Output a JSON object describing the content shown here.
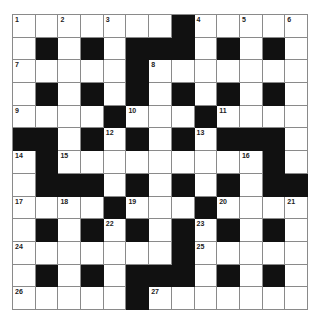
{
  "puzzle": {
    "type": "crossword",
    "size": {
      "rows": 13,
      "cols": 13
    },
    "colors": {
      "block": "#111111",
      "cell": "#ffffff",
      "grid_line": "#8a8a8a"
    },
    "grid": [
      [
        "1",
        "W",
        "2",
        "W",
        "3",
        "W",
        "W",
        "B",
        "4",
        "W",
        "5",
        "W",
        "6"
      ],
      [
        "W",
        "B",
        "W",
        "B",
        "W",
        "B",
        "B",
        "B",
        "W",
        "B",
        "W",
        "B",
        "W"
      ],
      [
        "7",
        "W",
        "W",
        "W",
        "W",
        "B",
        "8",
        "W",
        "W",
        "W",
        "W",
        "W",
        "W"
      ],
      [
        "W",
        "B",
        "W",
        "B",
        "W",
        "B",
        "W",
        "B",
        "W",
        "B",
        "W",
        "B",
        "W"
      ],
      [
        "9",
        "W",
        "W",
        "W",
        "B",
        "10",
        "W",
        "W",
        "B",
        "11",
        "W",
        "W",
        "W"
      ],
      [
        "B",
        "B",
        "W",
        "B",
        "12",
        "B",
        "W",
        "B",
        "13",
        "B",
        "B",
        "B",
        "W"
      ],
      [
        "14",
        "B",
        "15",
        "W",
        "W",
        "W",
        "W",
        "W",
        "W",
        "W",
        "16",
        "B",
        "W"
      ],
      [
        "W",
        "B",
        "B",
        "B",
        "W",
        "B",
        "W",
        "B",
        "W",
        "B",
        "W",
        "B",
        "B"
      ],
      [
        "17",
        "W",
        "18",
        "W",
        "B",
        "19",
        "W",
        "W",
        "B",
        "20",
        "W",
        "W",
        "21"
      ],
      [
        "W",
        "B",
        "W",
        "B",
        "22",
        "B",
        "W",
        "B",
        "23",
        "B",
        "W",
        "B",
        "W"
      ],
      [
        "24",
        "W",
        "W",
        "W",
        "W",
        "W",
        "W",
        "B",
        "25",
        "W",
        "W",
        "W",
        "W"
      ],
      [
        "W",
        "B",
        "W",
        "B",
        "W",
        "B",
        "B",
        "B",
        "W",
        "B",
        "W",
        "B",
        "W"
      ],
      [
        "26",
        "W",
        "W",
        "W",
        "W",
        "B",
        "27",
        "W",
        "W",
        "W",
        "W",
        "W",
        "W"
      ]
    ],
    "clue_numbers": [
      "1",
      "2",
      "3",
      "4",
      "5",
      "6",
      "7",
      "8",
      "9",
      "10",
      "11",
      "12",
      "13",
      "14",
      "15",
      "16",
      "17",
      "18",
      "19",
      "20",
      "21",
      "22",
      "23",
      "24",
      "25",
      "26",
      "27"
    ]
  }
}
